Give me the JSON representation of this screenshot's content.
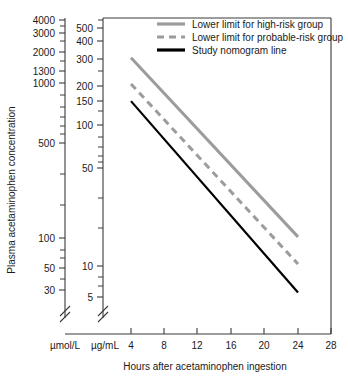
{
  "chart_data": {
    "type": "line",
    "title": "",
    "xlabel": "Hours after acetaminophen ingestion",
    "ylabel": "Plasma acetaminophen concentration",
    "x_ticks": [
      4,
      8,
      12,
      16,
      20,
      24,
      28
    ],
    "xlim": [
      2,
      28
    ],
    "y_axes": [
      {
        "unit": "µmol/L",
        "scale": "log",
        "ylim": [
          30,
          4000
        ],
        "ticks_labeled": [
          4000,
          3000,
          2000,
          1300,
          1000,
          500,
          100,
          50,
          30
        ],
        "ticks_minor": [
          900,
          800,
          700,
          600,
          400,
          300,
          200,
          90,
          80,
          70,
          60,
          40
        ],
        "axis_break": true
      },
      {
        "unit": "µg/mL",
        "scale": "log",
        "ylim": [
          5,
          520
        ],
        "ticks_labeled": [
          500,
          400,
          300,
          200,
          150,
          100,
          50,
          10,
          5
        ],
        "ticks_minor": [
          250,
          90,
          80,
          70,
          60,
          40,
          30,
          20,
          9,
          8,
          7,
          6
        ],
        "axis_break": true
      }
    ],
    "grid": false,
    "legend_position": "top-right",
    "series": [
      {
        "name": "Lower limit for high-risk group",
        "color": "#9c9c9c",
        "style": "solid",
        "width": 3,
        "points": [
          {
            "x": 4,
            "y_ug_ml": 300
          },
          {
            "x": 24,
            "y_ug_ml": 14
          }
        ]
      },
      {
        "name": "Lower limit for probable-risk group",
        "color": "#9c9c9c",
        "style": "dashed",
        "width": 3,
        "points": [
          {
            "x": 4,
            "y_ug_ml": 192
          },
          {
            "x": 24,
            "y_ug_ml": 8.8
          }
        ]
      },
      {
        "name": "Study nomogram line",
        "color": "#000000",
        "style": "solid",
        "width": 2.2,
        "points": [
          {
            "x": 4,
            "y_ug_ml": 143
          },
          {
            "x": 24,
            "y_ug_ml": 5.4
          }
        ]
      }
    ]
  },
  "axis": {
    "x_title": "Hours after acetaminophen ingestion",
    "y_title": "Plasma acetaminophen concentration",
    "unit_left": "µmol/L",
    "unit_right": "µg/mL",
    "x_tick_labels": [
      "4",
      "8",
      "12",
      "16",
      "20",
      "24",
      "28"
    ],
    "y_left_tick_labels": [
      "4000",
      "3000",
      "2000",
      "1300",
      "1000",
      "500",
      "100",
      "50",
      "30"
    ],
    "y_right_tick_labels": [
      "500",
      "400",
      "300",
      "200",
      "150",
      "100",
      "50",
      "10",
      "5"
    ]
  },
  "legend": {
    "items": [
      {
        "label": "Lower limit for high-risk group",
        "color": "#9c9c9c",
        "style": "solid"
      },
      {
        "label": "Lower limit for probable-risk group",
        "color": "#9c9c9c",
        "style": "dashed"
      },
      {
        "label": "Study nomogram line",
        "color": "#000000",
        "style": "solid"
      }
    ]
  },
  "colors": {
    "gray": "#9c9c9c",
    "black": "#000000",
    "frame": "#3a3a3a",
    "text": "#1a1a1a"
  }
}
